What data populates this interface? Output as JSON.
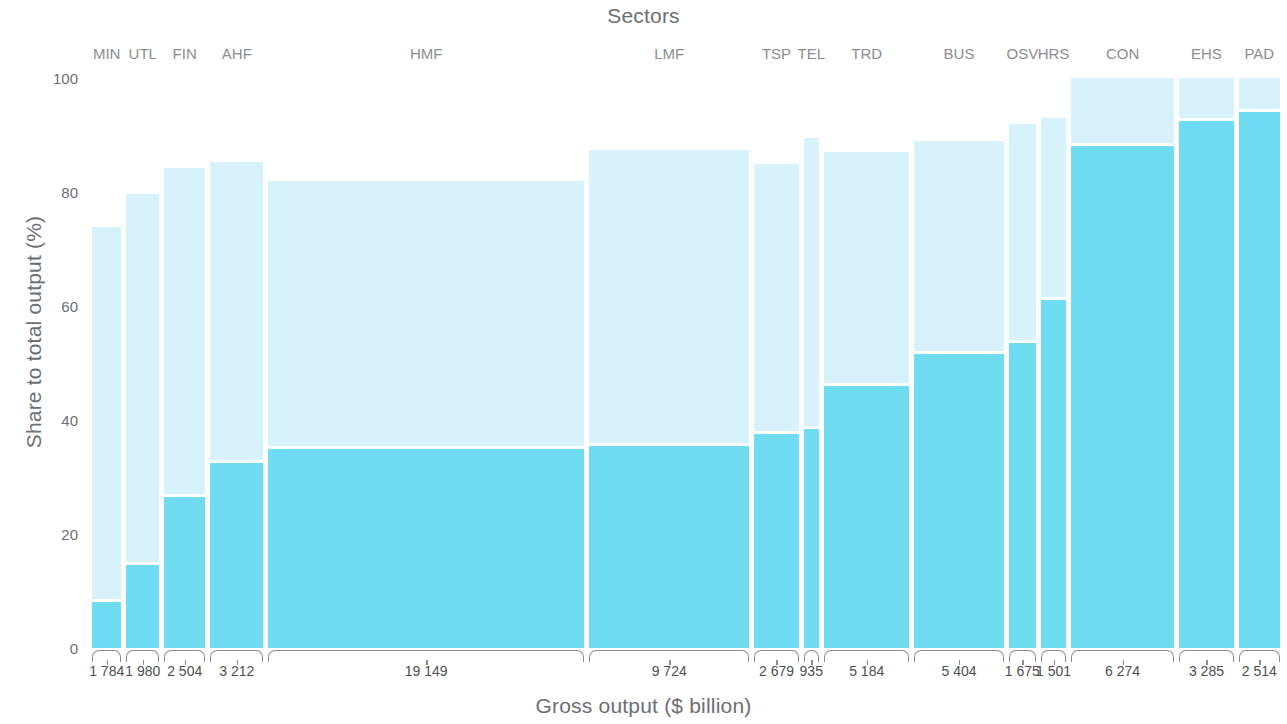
{
  "chart_data": {
    "type": "bar",
    "title": "Sectors",
    "xlabel": "Gross output ($ billion)",
    "ylabel": "Share to total output (%)",
    "ylim": [
      0,
      100
    ],
    "yticks": [
      0,
      20,
      40,
      60,
      80,
      100
    ],
    "grid": false,
    "legend": "none",
    "note": "Marimekko / mosaic chart: bar width is proportional to gross output ($ billion); bar height is share to total output (%), split into a lower (darker) and an upper (lighter) stacked segment.",
    "colors": {
      "segment_lower": "#6fdcf2",
      "segment_upper": "#d7f2fb",
      "background": "#ffffff",
      "text": "#6d6e71",
      "axis": "#8a8c8e"
    },
    "categories": [
      "MIN",
      "UTL",
      "FIN",
      "AHF",
      "HMF",
      "LMF",
      "TSP",
      "TEL",
      "TRD",
      "BUS",
      "OSV",
      "HRS",
      "CON",
      "EHS",
      "PAD"
    ],
    "widths": [
      1784,
      1980,
      2504,
      3212,
      19149,
      9724,
      2679,
      935,
      5184,
      5404,
      1675,
      1501,
      6274,
      3285,
      2514
    ],
    "width_labels": [
      "1 784",
      "1 980",
      "2 504",
      "3 212",
      "19 149",
      "9 724",
      "2 679",
      "935",
      "5 184",
      "5 404",
      "1 675",
      "1 501",
      "6 274",
      "3 285",
      "2 514"
    ],
    "series": [
      {
        "name": "lower segment",
        "values": [
          8.0,
          14.5,
          26.5,
          32.5,
          35.0,
          35.5,
          37.5,
          38.5,
          46.0,
          51.5,
          53.5,
          61.0,
          88.0,
          92.5,
          94.0
        ]
      },
      {
        "name": "upper segment",
        "values": [
          65.8,
          65.2,
          57.8,
          52.8,
          47.0,
          51.8,
          47.5,
          51.0,
          41.0,
          37.5,
          38.5,
          32.0,
          12.0,
          7.5,
          6.0
        ]
      }
    ],
    "totals": [
      73.8,
      79.7,
      84.3,
      85.3,
      82.0,
      87.3,
      85.0,
      89.5,
      87.0,
      89.0,
      92.0,
      93.0,
      100.0,
      100.0,
      100.0
    ]
  }
}
